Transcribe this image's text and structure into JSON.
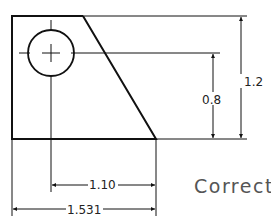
{
  "drawing": {
    "type": "technical-drawing",
    "dimensions": {
      "height_total": "1.2",
      "height_hole": "0.8",
      "width_hole": "1.10",
      "width_total": "1.531"
    }
  },
  "label": "Correct",
  "colors": {
    "line": "#111111",
    "label": "#555555"
  }
}
